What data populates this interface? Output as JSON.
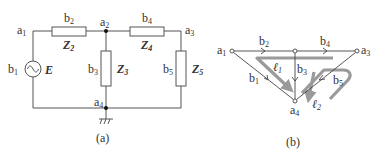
{
  "figure_a": {
    "caption": "(a)",
    "nodes": {
      "a1": {
        "main": "a",
        "sub": "1"
      },
      "a2": {
        "main": "a",
        "sub": "2"
      },
      "a3": {
        "main": "a",
        "sub": "3"
      },
      "a4": {
        "main": "a",
        "sub": "4"
      }
    },
    "branches": {
      "b1": {
        "main": "b",
        "sub": "1"
      },
      "b2": {
        "main": "b",
        "sub": "2"
      },
      "b3": {
        "main": "b",
        "sub": "3"
      },
      "b4": {
        "main": "b",
        "sub": "4"
      },
      "b5": {
        "main": "b",
        "sub": "5"
      }
    },
    "impedances": {
      "Z2": {
        "main": "Z",
        "sub": "2"
      },
      "Z3": {
        "main": "Z",
        "sub": "3"
      },
      "Z4": {
        "main": "Z",
        "sub": "4"
      },
      "Z5": {
        "main": "Z",
        "sub": "5"
      }
    },
    "source": {
      "label": "E",
      "icon": "ac-source-icon"
    },
    "ground": {
      "icon": "ground-icon"
    }
  },
  "figure_b": {
    "caption": "(b)",
    "nodes": {
      "a1": {
        "main": "a",
        "sub": "1"
      },
      "a3": {
        "main": "a",
        "sub": "3"
      },
      "a4": {
        "main": "a",
        "sub": "4"
      }
    },
    "branches": {
      "b1": {
        "main": "b",
        "sub": "1"
      },
      "b2": {
        "main": "b",
        "sub": "2"
      },
      "b3": {
        "main": "b",
        "sub": "3"
      },
      "b4": {
        "main": "b",
        "sub": "4"
      },
      "b5": {
        "main": "b",
        "sub": "5"
      }
    },
    "loops": {
      "l1": {
        "main": "ℓ",
        "sub": "1"
      },
      "l2": {
        "main": "ℓ",
        "sub": "2"
      }
    },
    "colors": {
      "edge": "#444444",
      "loop": "#9a9a9a"
    }
  }
}
